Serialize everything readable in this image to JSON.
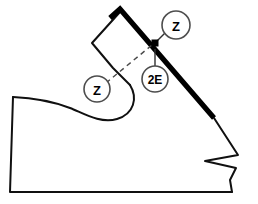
{
  "diagram": {
    "type": "technical-line-drawing",
    "background_color": "#ffffff",
    "line_color": "#101010",
    "seam_color": "#000000",
    "balloon_stroke_color": "#4d4d4d",
    "dashed_color": "#4a4a4a"
  },
  "balloons": [
    {
      "id": "balloon-z-upper",
      "label": "Z",
      "cx": 176,
      "cy": 25,
      "r": 14,
      "meaning": "stitch-callout-z-upper"
    },
    {
      "id": "balloon-2e",
      "label": "2E",
      "cx": 155,
      "cy": 79,
      "r": 13,
      "meaning": "width-size-callout-2e"
    },
    {
      "id": "balloon-z-lower",
      "label": "Z",
      "cx": 97,
      "cy": 89,
      "r": 13,
      "meaning": "stitch-callout-z-lower"
    }
  ],
  "markers": [
    {
      "id": "seam-node",
      "x": 155,
      "y": 43,
      "size": 6,
      "shape": "square"
    }
  ],
  "geometry": {
    "tongue_outline": "M 120 12 L 92 43 L 113 68 L 130 85",
    "thick_seam": "M 110 18 L 120 9 L 214 118",
    "quarter_curve": "M 130 85 C 138 98 134 114 117 119 C 100 124 83 113 70 108 C 57 103 35 98 13 97",
    "heel_and_sole": "M 13 97 L 10 192 L 232 192",
    "toe_detail": "M 214 118 L 238 155 L 205 161 L 236 168 L 230 180 L 232 192",
    "leader_upper_z": "M 165 33 L 157 41",
    "leader_2e": "M 155 49 L 155 66",
    "dashed_leader_z_lower": "M 106 83 L 152 45"
  }
}
